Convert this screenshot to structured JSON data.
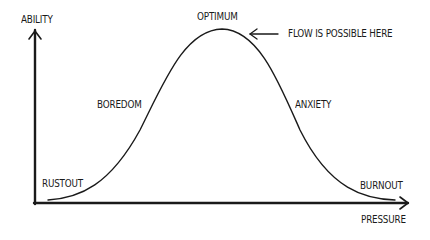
{
  "diagram": {
    "type": "inverted-u-curve",
    "y_axis_label": "ABILITY",
    "x_axis_label": "PRESSURE",
    "peak_label": "OPTIMUM",
    "annotation": "FLOW IS POSSIBLE HERE",
    "rising_label": "BOREDOM",
    "falling_label": "ANXIETY",
    "left_end_label": "RUSTOUT",
    "right_end_label": "BURNOUT",
    "line_color": "#1a1a1a"
  }
}
